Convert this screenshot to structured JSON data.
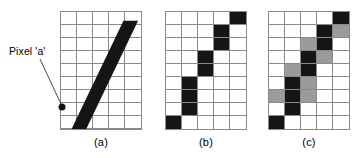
{
  "figure": {
    "annotation": {
      "label": "Pixel 'a'",
      "label_x": 9,
      "label_y": 45,
      "leader_line": {
        "x1": 40,
        "y1": 59,
        "x2": 61,
        "y2": 104
      },
      "dot": {
        "cx": 62,
        "cy": 107,
        "r": 3.5
      }
    },
    "colors": {
      "black": "#151515",
      "gray": "#9b9b9b",
      "white": "#ffffff",
      "grid_line": "#8a8a8a"
    },
    "grid": {
      "columns": 5,
      "rows": 9,
      "cell_width": 16,
      "cell_height": 13
    },
    "panels": [
      {
        "id": "a",
        "caption": "(a)",
        "type": "continuous-line",
        "description": "Grid overlaid with a thick black diagonal band running from lower-left to upper-right",
        "band": {
          "points": "7,127 22,127 79,9 64,9",
          "fill": "#151515"
        },
        "cells": [
          [
            "white",
            "white",
            "white",
            "white",
            "white"
          ],
          [
            "white",
            "white",
            "white",
            "white",
            "white"
          ],
          [
            "white",
            "white",
            "white",
            "white",
            "white"
          ],
          [
            "white",
            "white",
            "white",
            "white",
            "white"
          ],
          [
            "white",
            "white",
            "white",
            "white",
            "white"
          ],
          [
            "white",
            "white",
            "white",
            "white",
            "white"
          ],
          [
            "white",
            "white",
            "white",
            "white",
            "white"
          ],
          [
            "white",
            "white",
            "white",
            "white",
            "white"
          ],
          [
            "white",
            "white",
            "white",
            "white",
            "white"
          ]
        ]
      },
      {
        "id": "b",
        "caption": "(b)",
        "type": "aliased-rasterization",
        "description": "Binary rasterization of the line: black pixels only, producing a jagged staircase",
        "cells": [
          [
            "white",
            "white",
            "white",
            "white",
            "black"
          ],
          [
            "white",
            "white",
            "white",
            "black",
            "white"
          ],
          [
            "white",
            "white",
            "white",
            "black",
            "white"
          ],
          [
            "white",
            "white",
            "black",
            "white",
            "white"
          ],
          [
            "white",
            "white",
            "black",
            "white",
            "white"
          ],
          [
            "white",
            "black",
            "white",
            "white",
            "white"
          ],
          [
            "white",
            "black",
            "white",
            "white",
            "white"
          ],
          [
            "white",
            "black",
            "white",
            "white",
            "white"
          ],
          [
            "black",
            "white",
            "white",
            "white",
            "white"
          ]
        ]
      },
      {
        "id": "c",
        "caption": "(c)",
        "type": "antialiased-rasterization",
        "description": "Anti-aliased rasterization: black core pixels flanked by gray partial-coverage pixels",
        "cells": [
          [
            "white",
            "white",
            "white",
            "white",
            "black"
          ],
          [
            "white",
            "white",
            "white",
            "black",
            "gray"
          ],
          [
            "white",
            "white",
            "gray",
            "black",
            "white"
          ],
          [
            "white",
            "white",
            "black",
            "gray",
            "white"
          ],
          [
            "white",
            "gray",
            "black",
            "white",
            "white"
          ],
          [
            "white",
            "black",
            "gray",
            "white",
            "white"
          ],
          [
            "gray",
            "black",
            "gray",
            "white",
            "white"
          ],
          [
            "white",
            "black",
            "white",
            "white",
            "white"
          ],
          [
            "black",
            "white",
            "white",
            "white",
            "white"
          ]
        ]
      }
    ]
  }
}
